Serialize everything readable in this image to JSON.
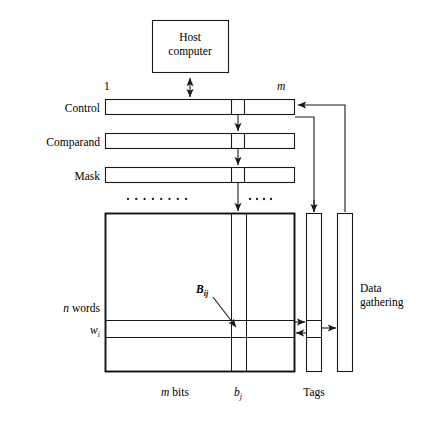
{
  "figure": {
    "type": "associative-memory-architecture-diagram",
    "background_color": "#ffffff",
    "line_color": "#1a1a1a"
  },
  "blocks": {
    "host": {
      "line1": "Host",
      "line2": "computer"
    },
    "registers": [
      {
        "label": "Control"
      },
      {
        "label": "Comparand"
      },
      {
        "label": "Mask"
      }
    ],
    "tags": {
      "label": "Tags"
    },
    "data_gathering": {
      "line1": "Data",
      "line2": "gathering"
    }
  },
  "annotations": {
    "bit_first": "1",
    "bit_last": "m",
    "width_label_italic": "m",
    "width_label_rest": " bits",
    "bit_column": "b",
    "bit_column_sub": "j",
    "rows_label_italic": "n",
    "rows_label_rest": " words",
    "word_row": "w",
    "word_row_sub": "i",
    "cell": "B",
    "cell_sub": "ij"
  },
  "ellipses": {
    "left_count": 8,
    "right_count": 4
  }
}
